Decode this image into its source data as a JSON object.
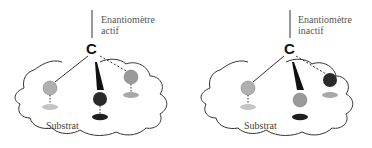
{
  "panels": [
    {
      "id": "active",
      "title_line1": "Enantiomètre",
      "title_line2": "actif",
      "center_atom": "C",
      "substrate_label": "Substrat",
      "groups": [
        {
          "position": "left",
          "sphere_color": "#b0b0b0",
          "site_color": "#c4c4c4",
          "bound": true
        },
        {
          "position": "center",
          "sphere_color": "#2a2a2a",
          "site_color": "#1e1e1e",
          "bound": true
        },
        {
          "position": "right",
          "sphere_color": "#9a9a9a",
          "site_color": "#a8a8a8",
          "bound": true
        }
      ]
    },
    {
      "id": "inactive",
      "title_line1": "Enantiomètre",
      "title_line2": "inactif",
      "center_atom": "C",
      "substrate_label": "Substrat",
      "groups": [
        {
          "position": "left",
          "sphere_color": "#b0b0b0",
          "site_color": "#c4c4c4",
          "bound": true
        },
        {
          "position": "center",
          "sphere_color": "#9a9a9a",
          "site_color": "#1e1e1e",
          "bound": false
        },
        {
          "position": "right",
          "sphere_color": "#2a2a2a",
          "site_color": "#a8a8a8",
          "bound": false
        }
      ]
    }
  ]
}
